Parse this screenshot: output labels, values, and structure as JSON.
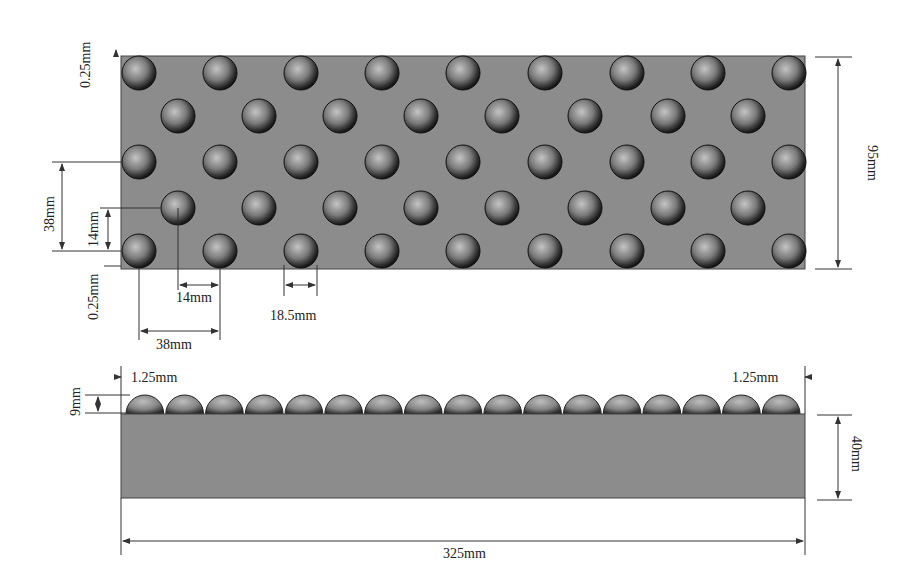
{
  "diagram": {
    "type": "engineering-dimension-drawing",
    "colors": {
      "plate": "#8c8c8c",
      "sphere_dark": "#1e1e1e",
      "sphere_light": "#b8b8b8",
      "dim_line": "#333333",
      "background": "#ffffff"
    },
    "top_view": {
      "rows": [
        {
          "y": 73,
          "xs": [
            139,
            220,
            301,
            382,
            463,
            545,
            627,
            708,
            789
          ]
        },
        {
          "y": 116,
          "xs": [
            178,
            259,
            340,
            421,
            502,
            585,
            668,
            748
          ]
        },
        {
          "y": 162,
          "xs": [
            139,
            220,
            301,
            382,
            463,
            545,
            627,
            708,
            789
          ]
        },
        {
          "y": 208,
          "xs": [
            178,
            259,
            340,
            421,
            502,
            585,
            668,
            748
          ]
        },
        {
          "y": 251,
          "xs": [
            139,
            220,
            301,
            382,
            463,
            545,
            627,
            708,
            789
          ]
        }
      ],
      "sphere_radius": 17,
      "labels": {
        "edge_gap_top": "0.25mm",
        "edge_gap_bottom": "0.25mm",
        "row_pitch": "38mm",
        "row_offset": "14mm",
        "col_offset": "14mm",
        "col_pitch": "38mm",
        "sphere_diameter": "18.5mm",
        "width": "95mm"
      }
    },
    "side_view": {
      "dome_count": 17,
      "labels": {
        "left_gap": "1.25mm",
        "right_gap": "1.25mm",
        "dome_height": "9mm",
        "base_height": "40mm",
        "total_length": "325mm"
      }
    }
  }
}
